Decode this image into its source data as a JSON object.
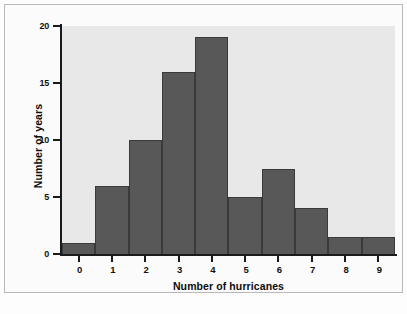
{
  "chart_data": {
    "type": "bar",
    "title": "",
    "subtitle": "",
    "xlabel": "Number of hurricanes",
    "ylabel": "Number of years",
    "categories": [
      "0",
      "1",
      "2",
      "3",
      "4",
      "5",
      "6",
      "7",
      "8",
      "9"
    ],
    "values": [
      1,
      6,
      10,
      16,
      19,
      5,
      7.5,
      4,
      1.5,
      1.5
    ],
    "xlim": [
      -0.5,
      9.5
    ],
    "ylim": [
      0,
      20
    ],
    "yticks": [
      0,
      5,
      10,
      15,
      20
    ],
    "ytick_labels": [
      "0",
      "5",
      "10",
      "15",
      "20"
    ],
    "xticks": [
      0,
      1,
      2,
      3,
      4,
      5,
      6,
      7,
      8,
      9
    ],
    "xtick_labels": [
      "0",
      "1",
      "2",
      "3",
      "4",
      "5",
      "6",
      "7",
      "8",
      "9"
    ],
    "grid": false,
    "legend": null,
    "bar_color": "#585859",
    "bar_edge_color": "#3a3a3c",
    "plot_background": "#e8e8e8",
    "figure_background": "#fbfbfb",
    "axis_color": "#1b1b1b",
    "text_color": "#111111"
  }
}
